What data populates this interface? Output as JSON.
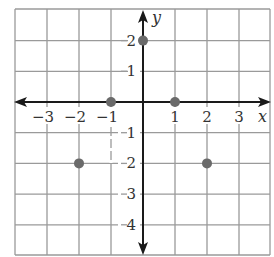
{
  "chart_data": {
    "type": "scatter",
    "title": "",
    "xlabel": "x",
    "ylabel": "y",
    "xlim": [
      -4,
      4
    ],
    "ylim": [
      -5,
      3
    ],
    "grid": true,
    "x_ticks": [
      {
        "value": -3,
        "label": "−3"
      },
      {
        "value": -2,
        "label": "−2"
      },
      {
        "value": -1,
        "label": "−1"
      },
      {
        "value": 1,
        "label": "1"
      },
      {
        "value": 2,
        "label": "2"
      },
      {
        "value": 3,
        "label": "3"
      }
    ],
    "y_ticks": [
      {
        "value": 2,
        "label": "2"
      },
      {
        "value": 1,
        "label": "1"
      },
      {
        "value": -1,
        "label": "1"
      },
      {
        "value": -2,
        "label": "2"
      },
      {
        "value": -3,
        "label": "3"
      },
      {
        "value": -4,
        "label": "4"
      }
    ],
    "points": [
      {
        "x": 0,
        "y": 2
      },
      {
        "x": -1,
        "y": 0
      },
      {
        "x": 1,
        "y": 0
      },
      {
        "x": -2,
        "y": -2
      },
      {
        "x": 2,
        "y": -2
      }
    ],
    "colors": {
      "grid": "#9a9a9a",
      "axis": "#1a1a1a",
      "point": "#6a6a6a",
      "text": "#333333"
    }
  }
}
